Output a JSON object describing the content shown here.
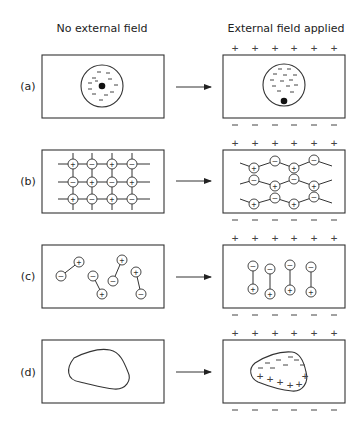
{
  "figure": {
    "column_titles": {
      "left": "No external field",
      "right": "External field applied"
    },
    "row_labels": [
      "(a)",
      "(b)",
      "(c)",
      "(d)"
    ],
    "plate_signs": {
      "top": "+",
      "bottom": "–",
      "count_per_plate": 6
    },
    "rows": [
      {
        "id": "a",
        "label": "(a)",
        "description": "Atom: electron cloud centered on nucleus; with field, nucleus displaced toward negative plate"
      },
      {
        "id": "b",
        "label": "(b)",
        "description": "Ionic lattice: alternating + and - ions on grid; with field, ions shift into zig-zag chains"
      },
      {
        "id": "c",
        "label": "(c)",
        "description": "Randomly oriented dipoles; with field, dipoles align (- up, + down)"
      },
      {
        "id": "d",
        "label": "(d)",
        "description": "Particle with no charge separation; with field, - accumulates at top, + at bottom"
      }
    ],
    "ion_signs": {
      "positive": "+",
      "negative": "–"
    }
  }
}
